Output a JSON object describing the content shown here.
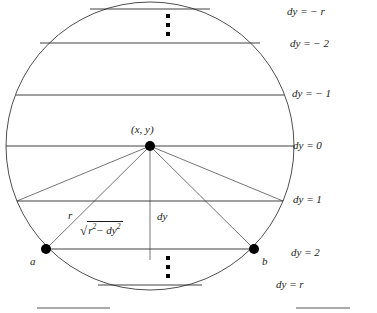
{
  "figure": {
    "geometry": {
      "circle_center_x": 150,
      "circle_center_y": 146,
      "circle_radius": 144,
      "stroke_color": "#3a3a3a",
      "chord_color": "#2b2b2b",
      "point_color": "#000000",
      "background": "#ffffff"
    },
    "chords": [
      {
        "id": "dy-minus-r",
        "label": "dy = − r",
        "y": 9,
        "half_width": 60,
        "label_x": 287,
        "label_y": 6
      },
      {
        "id": "dy-minus-2",
        "label": "dy = − 2",
        "y": 43,
        "half_width": 110,
        "label_x": 290,
        "label_y": 38
      },
      {
        "id": "dy-minus-1",
        "label": "dy = − 1",
        "y": 95,
        "half_width": 134,
        "label_x": 292,
        "label_y": 88
      },
      {
        "id": "dy-0",
        "label": "dy = 0",
        "y": 146,
        "half_width": 144,
        "label_x": 293,
        "label_y": 140
      },
      {
        "id": "dy-1",
        "label": "dy = 1",
        "y": 201,
        "half_width": 133,
        "label_x": 293,
        "label_y": 194
      },
      {
        "id": "dy-2",
        "label": "dy = 2",
        "y": 249,
        "half_width": 104,
        "label_x": 291,
        "label_y": 247
      },
      {
        "id": "dy-r",
        "label": "dy = r",
        "y": 285,
        "half_width": 52,
        "label_x": 276,
        "label_y": 279
      }
    ],
    "points": [
      {
        "id": "center-point",
        "label": "(x, y)",
        "x": 150,
        "y": 146,
        "label_x": 131,
        "label_y": 124,
        "radius": 5
      },
      {
        "id": "point-a",
        "label": "a",
        "x": 46,
        "y": 249,
        "label_x": 30,
        "label_y": 256,
        "radius": 5
      },
      {
        "id": "point-b",
        "label": "b",
        "x": 254,
        "y": 249,
        "label_x": 262,
        "label_y": 256,
        "radius": 5
      }
    ],
    "annotations": {
      "radius_label": "r",
      "radius_label_x": 68,
      "radius_label_y": 210,
      "dy_label": "dy",
      "dy_label_x": 157,
      "dy_label_y": 211,
      "chord_half_label_prefix": "√",
      "chord_half_radicand_a": "r",
      "chord_half_exp_a": "2",
      "chord_half_minus": "−",
      "chord_half_radicand_b": "dy",
      "chord_half_exp_b": "2",
      "chord_half_label_x": 80,
      "chord_half_label_y": 222
    },
    "ellipsis_dots": [
      {
        "id": "ellipsis-top",
        "x": 169,
        "ys": [
          16,
          25,
          34
        ]
      },
      {
        "id": "ellipsis-bottom",
        "x": 169,
        "ys": [
          258,
          267,
          276
        ]
      }
    ],
    "page_rules": [
      {
        "id": "rule-left",
        "x1": 37,
        "x2": 110,
        "y": 308
      },
      {
        "id": "rule-right",
        "x1": 296,
        "x2": 350,
        "y": 308
      }
    ]
  }
}
